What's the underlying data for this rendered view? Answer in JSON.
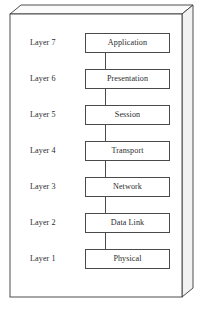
{
  "diagram": {
    "layers": [
      {
        "label": "Layer 7",
        "name": "Application"
      },
      {
        "label": "Layer 6",
        "name": "Presentation"
      },
      {
        "label": "Layer 5",
        "name": "Session"
      },
      {
        "label": "Layer 4",
        "name": "Transport"
      },
      {
        "label": "Layer 3",
        "name": "Network"
      },
      {
        "label": "Layer 2",
        "name": "Data Link"
      },
      {
        "label": "Layer 1",
        "name": "Physical"
      }
    ],
    "colors": {
      "background": "#ffffff",
      "box_border": "#4a4a4a",
      "enclosure_border": "#3a3a3a",
      "enclosure_side": "#f2f2f2",
      "text": "#2b2b2b",
      "connector": "#4a4a4a"
    },
    "enclosure": {
      "front_left": 10,
      "front_top": 14,
      "front_right": 182,
      "front_bottom": 297,
      "depth_x": 11,
      "depth_y": 9
    }
  }
}
